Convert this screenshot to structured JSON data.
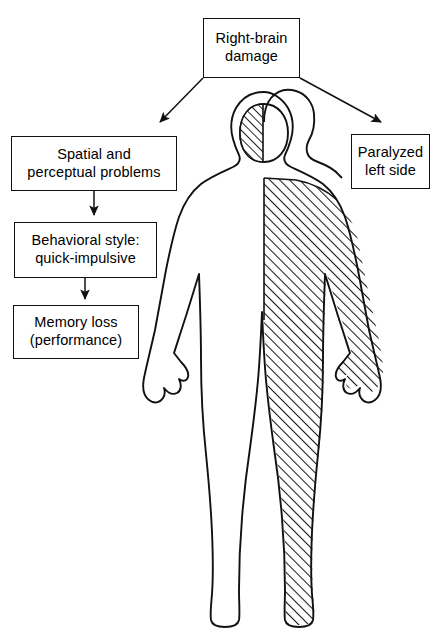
{
  "figure": {
    "title_box": {
      "lines": [
        "Right-brain",
        "damage"
      ],
      "line1": "Right-brain",
      "line2": "damage"
    },
    "left_boxes": [
      {
        "line1": "Spatial and",
        "line2": "perceptual problems"
      },
      {
        "line1": "Behavioral style:",
        "line2": "quick-impulsive"
      },
      {
        "line1": "Memory loss",
        "line2": "(performance)"
      }
    ],
    "right_box": {
      "line1": "Paralyzed",
      "line2": "left side"
    },
    "caption": "",
    "body_figure": {
      "hatched_side_label": "left side of body",
      "hatched_brain_label": "right hemisphere"
    },
    "colors": {
      "ink": "#111111",
      "background": "#ffffff",
      "hatch": "#222222"
    }
  }
}
